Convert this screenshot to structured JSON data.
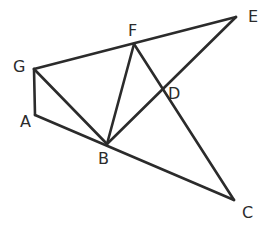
{
  "diagram": {
    "type": "geometry-figure",
    "line_color": "#2b2b2b",
    "background": "#ffffff",
    "points": {
      "A": {
        "label": "A",
        "x": 35,
        "y": 115,
        "lx": 20,
        "ly": 127
      },
      "B": {
        "label": "B",
        "x": 107,
        "y": 144,
        "lx": 98,
        "ly": 164
      },
      "C": {
        "label": "C",
        "x": 234,
        "y": 200,
        "lx": 242,
        "ly": 218
      },
      "D": {
        "label": "D",
        "x": 162,
        "y": 90,
        "lx": 168,
        "ly": 99
      },
      "E": {
        "label": "E",
        "x": 236,
        "y": 17,
        "lx": 248,
        "ly": 22
      },
      "F": {
        "label": "F",
        "x": 134,
        "y": 44,
        "lx": 128,
        "ly": 36
      },
      "G": {
        "label": "G",
        "x": 34,
        "y": 69,
        "lx": 13,
        "ly": 72
      }
    },
    "segments": [
      [
        "G",
        "E"
      ],
      [
        "G",
        "A"
      ],
      [
        "A",
        "C"
      ],
      [
        "G",
        "B"
      ],
      [
        "B",
        "F"
      ],
      [
        "B",
        "E"
      ],
      [
        "F",
        "C"
      ]
    ]
  }
}
